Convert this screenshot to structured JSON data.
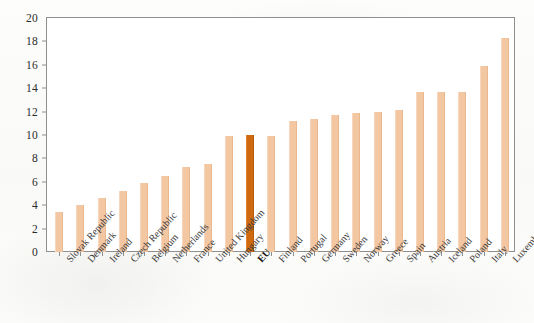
{
  "chart_data": {
    "type": "bar",
    "title": "",
    "subtitle": "",
    "xlabel": "",
    "ylabel": "",
    "ylim": [
      0,
      20
    ],
    "ytick_step": 2,
    "yticks": [
      20,
      18,
      16,
      14,
      12,
      10,
      8,
      6,
      4,
      2,
      0
    ],
    "grid": false,
    "legend": "none",
    "highlight_category": "EU",
    "colors": {
      "bar": "#f3c7a2",
      "highlight_bar": "#cf6a10",
      "axis": "#8f8f8f",
      "text": "#2b2b2b",
      "background": "#fbfbfa",
      "plot_background": "#ffffff"
    },
    "categories": [
      "Slovak Republic",
      "Denmark",
      "Ireland",
      "Czech Republic",
      "Belgium",
      "Netherlands",
      "France",
      "United Kingdom",
      "Hungary",
      "EU",
      "Finland",
      "Portugal",
      "Germany",
      "Sweden",
      "Norway",
      "Greece",
      "Spain",
      "Austria",
      "Iceland",
      "Poland",
      "Italy",
      "Luxembourg"
    ],
    "values": [
      3.45,
      4.0,
      4.6,
      5.25,
      5.9,
      6.5,
      7.3,
      7.55,
      9.9,
      10.0,
      9.95,
      11.2,
      11.35,
      11.7,
      11.9,
      12.0,
      12.1,
      13.7,
      13.7,
      13.7,
      15.9,
      18.3
    ],
    "bold_labels": [
      "EU"
    ]
  }
}
